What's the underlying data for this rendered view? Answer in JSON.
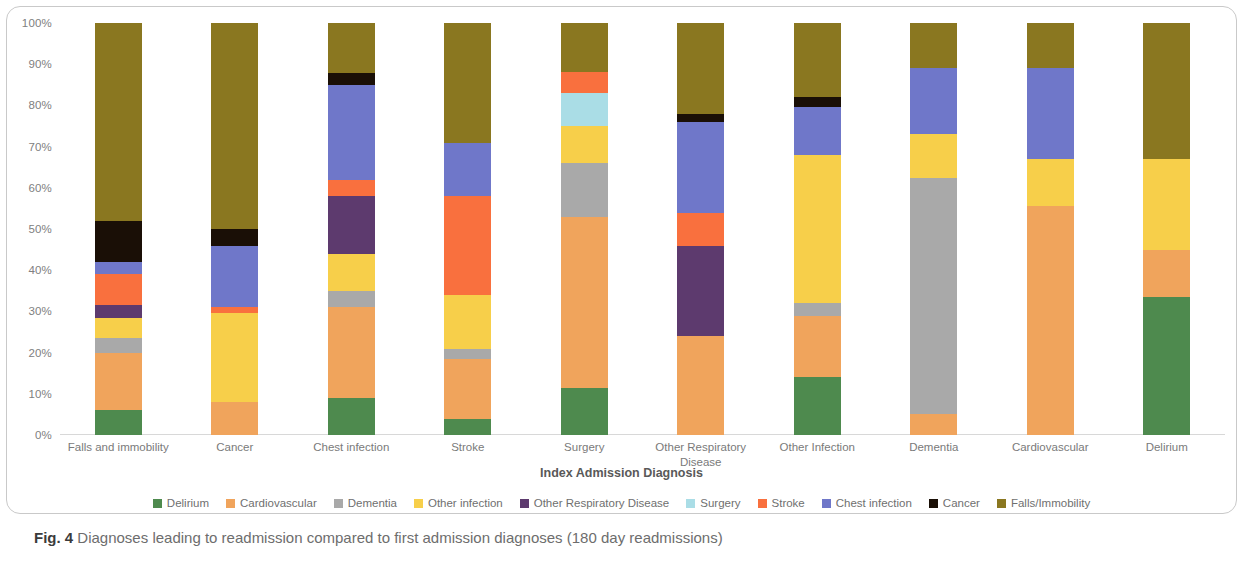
{
  "caption": {
    "figure_number": "Fig. 4",
    "text": " Diagnoses leading to readmission compared to first admission diagnoses (180 day readmissions)"
  },
  "axis_title": "Index Admission Diagnosis",
  "colors": {
    "delirium": "#4e8a4e",
    "cardiovascular": "#f0a45c",
    "dementia": "#a9a9a9",
    "other_infection": "#f7cf4a",
    "other_respiratory_disease": "#5d3a6e",
    "surgery": "#aadde6",
    "stroke": "#f9703e",
    "chest_infection": "#6f77c9",
    "cancer": "#1a0f06",
    "falls_immobility": "#8a7720"
  },
  "chart_data": {
    "type": "bar",
    "stacked": true,
    "normalized": true,
    "title": "",
    "xlabel": "Index Admission Diagnosis",
    "ylabel": "",
    "ylim": [
      0,
      100
    ],
    "grid": false,
    "legend_position": "bottom",
    "ytick_labels": [
      "100%",
      "90%",
      "80%",
      "70%",
      "60%",
      "50%",
      "40%",
      "30%",
      "20%",
      "10%",
      "0%"
    ],
    "ytick_values": [
      100,
      90,
      80,
      70,
      60,
      50,
      40,
      30,
      20,
      10,
      0
    ],
    "categories": [
      "Falls and immobility",
      "Cancer",
      "Chest infection",
      "Stroke",
      "Surgery",
      "Other Respiratory Disease",
      "Other Infection",
      "Dementia",
      "Cardiovascular",
      "Delirium"
    ],
    "series": [
      {
        "name": "Delirium",
        "color": "#4e8a4e",
        "values": [
          6.0,
          0.0,
          9.0,
          4.0,
          11.5,
          0.0,
          14.0,
          0.0,
          0.0,
          33.5
        ]
      },
      {
        "name": "Cardiovascular",
        "color": "#f0a45c",
        "values": [
          14.0,
          8.0,
          22.0,
          14.5,
          41.5,
          24.0,
          15.0,
          5.0,
          55.5,
          11.5
        ]
      },
      {
        "name": "Dementia",
        "color": "#a9a9a9",
        "values": [
          3.5,
          0.0,
          4.0,
          2.5,
          13.0,
          0.0,
          3.0,
          57.5,
          0.0,
          0.0
        ]
      },
      {
        "name": "Other infection",
        "color": "#f7cf4a",
        "values": [
          5.0,
          21.5,
          9.0,
          13.0,
          9.0,
          0.0,
          36.0,
          10.5,
          11.5,
          22.0
        ]
      },
      {
        "name": "Other Respiratory Disease",
        "color": "#5d3a6e",
        "values": [
          3.0,
          0.0,
          14.0,
          0.0,
          0.0,
          22.0,
          0.0,
          0.0,
          0.0,
          0.0
        ]
      },
      {
        "name": "Surgery",
        "color": "#aadde6",
        "values": [
          0.0,
          0.0,
          0.0,
          0.0,
          8.0,
          0.0,
          0.0,
          0.0,
          0.0,
          0.0
        ]
      },
      {
        "name": "Stroke",
        "color": "#f9703e",
        "values": [
          7.5,
          1.5,
          4.0,
          24.0,
          5.0,
          8.0,
          0.0,
          0.0,
          0.0,
          0.0
        ]
      },
      {
        "name": "Chest infection",
        "color": "#6f77c9",
        "values": [
          3.0,
          15.0,
          23.0,
          13.0,
          0.0,
          22.0,
          11.5,
          16.0,
          22.0,
          0.0
        ]
      },
      {
        "name": "Cancer",
        "color": "#1a0f06",
        "values": [
          10.0,
          4.0,
          3.0,
          0.0,
          0.0,
          2.0,
          2.5,
          0.0,
          0.0,
          0.0
        ]
      },
      {
        "name": "Falls/Immobility",
        "color": "#8a7720",
        "values": [
          48.0,
          50.0,
          12.0,
          29.0,
          12.0,
          22.0,
          18.0,
          11.0,
          11.0,
          33.0
        ]
      }
    ]
  }
}
